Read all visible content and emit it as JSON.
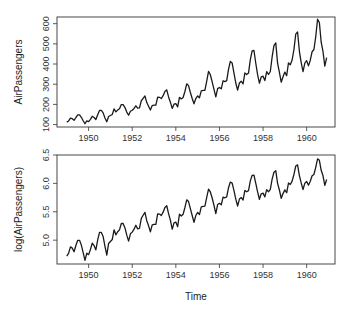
{
  "chart_data": [
    {
      "type": "line",
      "title": "",
      "xlabel": "",
      "ylabel": "AirPassengers",
      "xlim": [
        1949,
        1961
      ],
      "ylim": [
        100,
        630
      ],
      "x_ticks": [
        1950,
        1952,
        1954,
        1956,
        1958,
        1960
      ],
      "y_ticks": [
        100,
        200,
        300,
        400,
        500,
        600
      ],
      "grid": false,
      "legend": null,
      "x_start": 1949,
      "x_step": 0.0833333,
      "series": [
        {
          "name": "AirPassengers",
          "values": [
            112,
            118,
            132,
            129,
            121,
            135,
            148,
            148,
            136,
            119,
            104,
            118,
            115,
            126,
            141,
            135,
            125,
            149,
            170,
            170,
            158,
            133,
            114,
            140,
            145,
            150,
            178,
            163,
            172,
            178,
            199,
            199,
            184,
            162,
            146,
            166,
            171,
            180,
            193,
            181,
            183,
            218,
            230,
            242,
            209,
            191,
            172,
            194,
            196,
            196,
            236,
            235,
            229,
            243,
            264,
            272,
            237,
            211,
            180,
            201,
            204,
            188,
            235,
            227,
            234,
            264,
            302,
            293,
            259,
            229,
            203,
            229,
            242,
            233,
            267,
            269,
            270,
            315,
            364,
            347,
            312,
            274,
            237,
            278,
            284,
            277,
            317,
            313,
            318,
            374,
            413,
            405,
            355,
            306,
            271,
            306,
            315,
            301,
            356,
            348,
            355,
            422,
            465,
            467,
            404,
            347,
            305,
            336,
            340,
            318,
            362,
            348,
            363,
            435,
            491,
            505,
            404,
            359,
            310,
            337,
            360,
            342,
            406,
            396,
            420,
            472,
            548,
            559,
            463,
            407,
            362,
            405,
            417,
            391,
            419,
            461,
            472,
            535,
            622,
            606,
            508,
            461,
            390,
            432
          ]
        }
      ]
    },
    {
      "type": "line",
      "title": "",
      "xlabel": "Time",
      "ylabel": "log(AirPassengers)",
      "xlim": [
        1949,
        1961
      ],
      "ylim": [
        4.6,
        6.5
      ],
      "x_ticks": [
        1950,
        1952,
        1954,
        1956,
        1958,
        1960
      ],
      "y_ticks": [
        5.0,
        5.5,
        6.0,
        6.5
      ],
      "grid": false,
      "legend": null,
      "x_start": 1949,
      "x_step": 0.0833333,
      "series": [
        {
          "name": "log(AirPassengers)",
          "transform_of": "AirPassengers",
          "transform": "log"
        }
      ]
    }
  ],
  "labels": {
    "top_ylabel": "AirPassengers",
    "bottom_ylabel": "log(AirPassengers)",
    "xlabel": "Time",
    "top_x_ticks": [
      "1950",
      "1952",
      "1954",
      "1956",
      "1958",
      "1960"
    ],
    "top_y_ticks": [
      "100",
      "200",
      "300",
      "400",
      "500",
      "600"
    ],
    "bottom_x_ticks": [
      "1950",
      "1952",
      "1954",
      "1956",
      "1958",
      "1960"
    ],
    "bottom_y_ticks": [
      "5.0",
      "5.5",
      "6.0",
      "6.5"
    ]
  }
}
